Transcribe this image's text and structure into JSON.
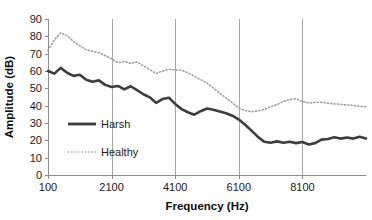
{
  "chart_data": {
    "type": "line",
    "title": "",
    "xlabel": "Frequency (Hz)",
    "ylabel": "Amplitude (dB)",
    "xlim": [
      100,
      10100
    ],
    "ylim": [
      0,
      90
    ],
    "xticks": [
      100,
      2100,
      4100,
      6100,
      8100
    ],
    "xtick_labels": [
      "100",
      "2100",
      "4100",
      "6100",
      "8100"
    ],
    "yticks": [
      0,
      10,
      20,
      30,
      40,
      50,
      60,
      70,
      80,
      90
    ],
    "ytick_labels": [
      "0",
      "10",
      "20",
      "30",
      "40",
      "50",
      "60",
      "70",
      "80",
      "90"
    ],
    "grid": "vertical-only",
    "legend_position": "inside-lower-left",
    "x": [
      100,
      300,
      500,
      700,
      900,
      1100,
      1300,
      1500,
      1700,
      1900,
      2100,
      2300,
      2500,
      2700,
      2900,
      3100,
      3300,
      3500,
      3700,
      3900,
      4100,
      4300,
      4500,
      4700,
      4900,
      5100,
      5300,
      5500,
      5700,
      5900,
      6100,
      6300,
      6500,
      6700,
      6900,
      7100,
      7300,
      7500,
      7700,
      7900,
      8100,
      8300,
      8500,
      8700,
      8900,
      9100,
      9300,
      9500,
      9700,
      9900,
      10100
    ],
    "series": [
      {
        "name": "Harsh",
        "style": "solid",
        "color": "#3d3d3d",
        "values": [
          60.0,
          58.5,
          61.8,
          59.0,
          57.2,
          57.8,
          55.0,
          53.8,
          54.6,
          52.0,
          50.8,
          51.4,
          49.4,
          51.2,
          49.0,
          46.6,
          44.8,
          41.6,
          43.8,
          44.6,
          41.0,
          38.0,
          36.2,
          34.8,
          36.8,
          38.4,
          37.6,
          36.6,
          35.6,
          34.2,
          32.0,
          29.0,
          25.6,
          22.0,
          19.2,
          18.6,
          19.4,
          18.6,
          19.2,
          18.4,
          19.0,
          17.6,
          18.4,
          20.4,
          20.8,
          21.8,
          21.0,
          21.6,
          21.0,
          22.0,
          21.0
        ]
      },
      {
        "name": "Healthy",
        "style": "dotted",
        "color": "#9a9a9a",
        "values": [
          72.0,
          78.0,
          82.0,
          80.4,
          77.0,
          74.6,
          72.2,
          71.4,
          70.6,
          68.8,
          67.0,
          64.8,
          65.6,
          64.4,
          65.2,
          63.0,
          60.8,
          58.6,
          60.0,
          61.0,
          60.6,
          60.4,
          59.0,
          57.0,
          55.0,
          53.0,
          50.2,
          47.2,
          44.4,
          41.6,
          38.6,
          37.2,
          36.4,
          37.0,
          37.8,
          39.4,
          40.6,
          42.4,
          43.6,
          44.0,
          42.4,
          41.6,
          41.8,
          42.0,
          41.4,
          41.0,
          40.8,
          40.4,
          40.2,
          39.6,
          39.4
        ]
      }
    ]
  },
  "legend": {
    "items": [
      {
        "label": "Harsh"
      },
      {
        "label": "Healthy"
      }
    ]
  }
}
